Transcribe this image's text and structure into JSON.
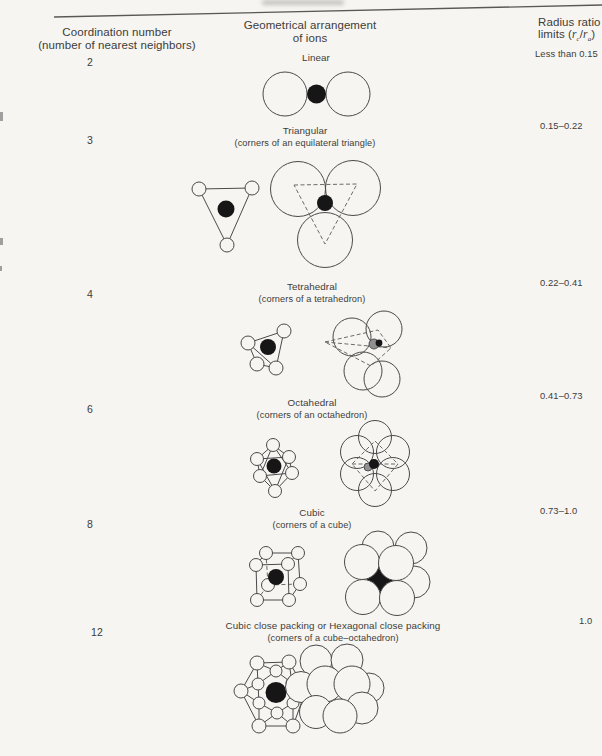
{
  "page": {
    "paper_color": "#f6f5f2",
    "ink_color": "#3e3c39"
  },
  "header": {
    "col1_line1": "Coordination number",
    "col1_line2": "(number of nearest neighbors)",
    "col2_line1": "Geometrical arrangement",
    "col2_line2": "of ions",
    "col3_line1": "Radius ratio",
    "col3_limits": {
      "pre": "limits (",
      "r1": "r",
      "sub1": "c",
      "slash": "/",
      "r2": "r",
      "sub2": "a",
      "post": ")"
    }
  },
  "rows": [
    {
      "coordination": "2",
      "name": "Linear",
      "subtitle": "",
      "ratio": "Less than 0.15"
    },
    {
      "coordination": "3",
      "name": "Triangular",
      "subtitle": "(corners of an equilateral triangle)",
      "ratio": "0.15–0.22"
    },
    {
      "coordination": "4",
      "name": "Tetrahedral",
      "subtitle": "(corners of a tetrahedron)",
      "ratio": "0.22–0.41"
    },
    {
      "coordination": "6",
      "name": "Octahedral",
      "subtitle": "(corners of an octahedron)",
      "ratio": "0.41–0.73"
    },
    {
      "coordination": "8",
      "name": "Cubic",
      "subtitle": "(corners of a cube)",
      "ratio": "0.73–1.0"
    },
    {
      "coordination": "12",
      "name": "Cubic close packing or Hexagonal close packing",
      "subtitle": "(corners of a cube–octahedron)",
      "ratio": "1.0"
    }
  ]
}
